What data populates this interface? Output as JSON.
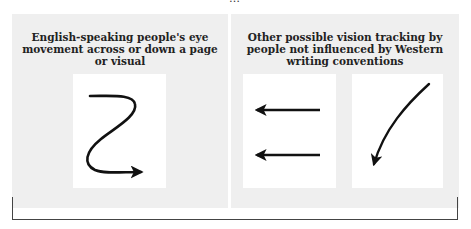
{
  "top_caption_cropped": "…",
  "panels": {
    "left": {
      "title": "English-speaking people's eye movement across or down a page or visual",
      "figures": [
        "z-path-arrow-icon"
      ]
    },
    "right": {
      "title": "Other possible vision tracking by people not influenced by Western writing conventions",
      "figures": [
        "double-left-arrow-icon",
        "curved-down-left-arrow-icon"
      ]
    }
  },
  "colors": {
    "panel_background": "#efefef",
    "figure_background": "#ffffff",
    "stroke": "#111111",
    "bracket": "#444444"
  }
}
